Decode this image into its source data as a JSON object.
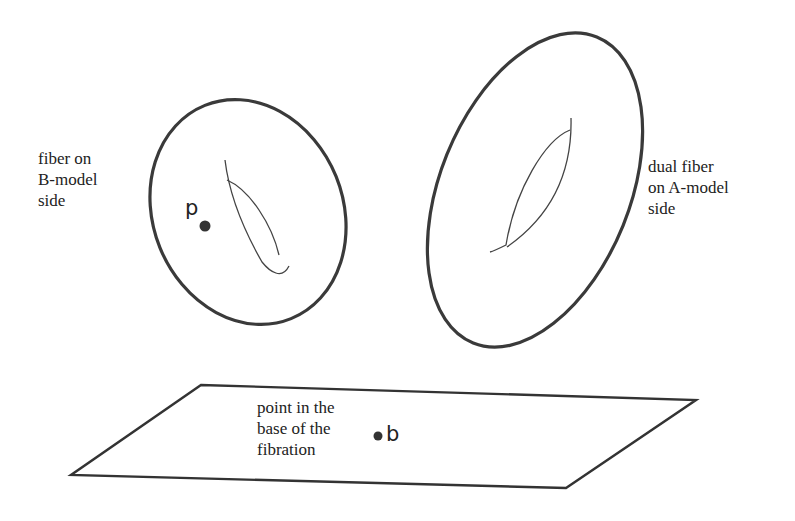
{
  "diagram": {
    "fiber_b_label": {
      "line1": "fiber on",
      "line2": "B-model",
      "line3": "side"
    },
    "fiber_a_label": {
      "line1": "dual fiber",
      "line2": "on A-model",
      "line3": "side"
    },
    "base_label": {
      "line1": "point in the",
      "line2": "base of the",
      "line3": "fibration"
    },
    "point_p": "p",
    "point_b": "b",
    "colors": {
      "stroke": "#333333",
      "text": "#222222",
      "background": "#ffffff"
    }
  }
}
